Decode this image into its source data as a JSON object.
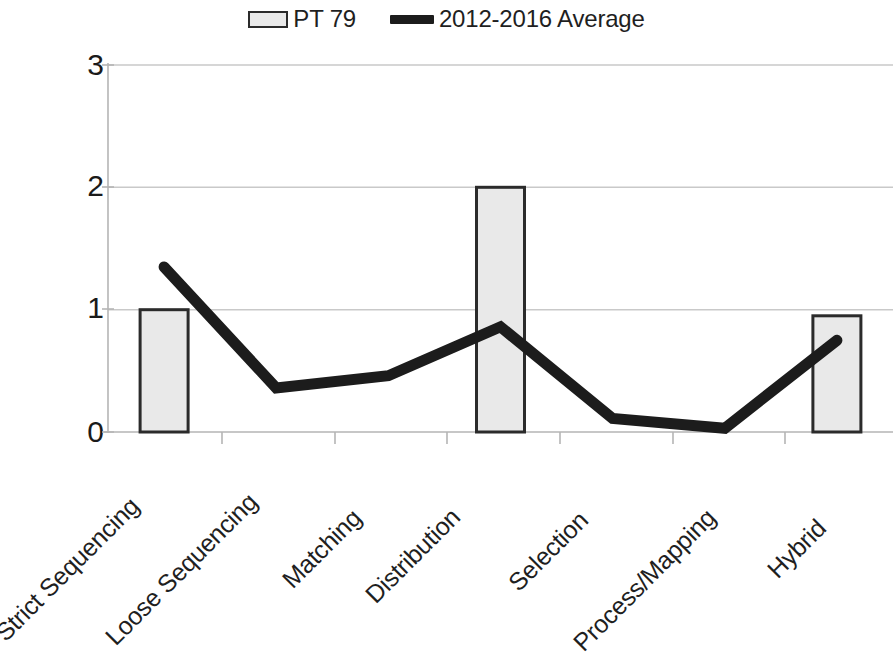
{
  "legend": {
    "items": [
      {
        "label": "PT 79",
        "type": "bar-swatch",
        "color": "#e9e9e9",
        "edge": "#2b2b2b"
      },
      {
        "label": "2012-2016 Average",
        "type": "line-swatch",
        "color": "#1c1c1c"
      }
    ]
  },
  "axis": {
    "y_ticks": [
      "0",
      "1",
      "2",
      "3"
    ],
    "y_min": 0,
    "y_max": 3
  },
  "colors": {
    "bar_fill": "#e9e9e9",
    "bar_edge": "#2b2b2b",
    "line": "#1c1c1c",
    "gridline": "#c9c9c9",
    "axis": "#b5b5b5",
    "text": "#1f1f1f",
    "background": "#ffffff"
  },
  "chart_data": {
    "type": "bar",
    "title": "",
    "subtitle": "",
    "xlabel": "",
    "ylabel": "",
    "ylim": [
      0,
      3
    ],
    "yticks": [
      0,
      1,
      2,
      3
    ],
    "grid": true,
    "legend_position": "top-center",
    "categories": [
      "Strict Sequencing",
      "Loose Sequencing",
      "Matching",
      "Distribution",
      "Selection",
      "Process/Mapping",
      "Hybrid"
    ],
    "series": [
      {
        "name": "PT 79",
        "type": "bar",
        "values": [
          1,
          0,
          0,
          2,
          0,
          0,
          0.95
        ]
      },
      {
        "name": "2012-2016 Average",
        "type": "line",
        "values": [
          1.35,
          0.36,
          0.46,
          0.86,
          0.11,
          0.03,
          0.75
        ]
      }
    ]
  }
}
